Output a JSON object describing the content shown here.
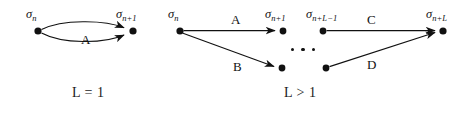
{
  "figure": {
    "background_color": "#ffffff",
    "ink_color": "#111111",
    "panels": [
      {
        "id": "panel-left",
        "caption": "L = 1",
        "nodes": [
          {
            "id": "node-sigma-n-left",
            "label_base": "σ",
            "label_sub": "n",
            "cx": 38,
            "cy": 31
          },
          {
            "id": "node-sigma-n-plus-1-left",
            "label_base": "σ",
            "label_sub": "n+1",
            "cx": 133,
            "cy": 31
          }
        ],
        "edges": [
          {
            "id": "edge-a-upper",
            "label": "A",
            "from": "node-sigma-n-left",
            "to": "node-sigma-n-plus-1-left",
            "style": "curved-up"
          },
          {
            "id": "edge-a-lower",
            "label": "",
            "from": "node-sigma-n-left",
            "to": "node-sigma-n-plus-1-left",
            "style": "curved-down"
          }
        ]
      },
      {
        "id": "panel-right",
        "caption": "L > 1",
        "nodes": [
          {
            "id": "node-sigma-n-right",
            "label_base": "σ",
            "label_sub": "n",
            "cx": 180,
            "cy": 31
          },
          {
            "id": "node-sigma-n-plus-1-right",
            "label_base": "σ",
            "label_sub": "n+1",
            "cx": 283,
            "cy": 31
          },
          {
            "id": "node-sigma-n-plus-l-minus-1",
            "label_base": "σ",
            "label_sub": "n+L−1",
            "cx": 323,
            "cy": 31
          },
          {
            "id": "node-sigma-n-plus-l",
            "label_base": "σ",
            "label_sub": "n+L",
            "cx": 443,
            "cy": 31
          },
          {
            "id": "node-lower-left",
            "label_base": "",
            "label_sub": "",
            "cx": 282,
            "cy": 68
          },
          {
            "id": "node-lower-right",
            "label_base": "",
            "label_sub": "",
            "cx": 326,
            "cy": 68
          }
        ],
        "edges": [
          {
            "id": "edge-a",
            "label": "A",
            "from": "node-sigma-n-right",
            "to": "node-sigma-n-plus-1-right",
            "style": "straight"
          },
          {
            "id": "edge-b",
            "label": "B",
            "from": "node-sigma-n-right",
            "to": "node-lower-left",
            "style": "straight"
          },
          {
            "id": "edge-c",
            "label": "C",
            "from": "node-sigma-n-plus-l-minus-1",
            "to": "node-sigma-n-plus-l",
            "style": "straight"
          },
          {
            "id": "edge-d",
            "label": "D",
            "from": "node-lower-right",
            "to": "node-sigma-n-plus-l",
            "style": "straight"
          }
        ],
        "ellipsis": "• • •"
      }
    ],
    "labels": {
      "sigma_n": "σ",
      "sub_n": "n",
      "sub_n_plus_1": "n+1",
      "sub_n_plus_L_minus_1": "n+L−1",
      "sub_n_plus_L": "n+L",
      "edge_a": "A",
      "edge_b": "B",
      "edge_c": "C",
      "edge_d": "D",
      "caption_left": "L = 1",
      "caption_right": "L > 1"
    }
  }
}
